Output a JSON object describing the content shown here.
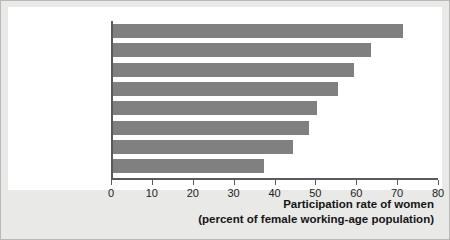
{
  "chart_data": {
    "type": "bar",
    "orientation": "horizontal",
    "title": "",
    "xlabel_line1": "Participation rate of women",
    "xlabel_line2": "(percent of female working-age population)",
    "ylabel": "",
    "categories": [
      "Iceland",
      "Norway",
      "United States",
      "United Kingdom",
      "Germany",
      "France",
      "Spain",
      "Italy"
    ],
    "values": [
      71,
      63,
      59,
      55,
      50,
      48,
      44,
      37
    ],
    "xlim": [
      0,
      80
    ],
    "xticks": [
      0,
      10,
      20,
      30,
      40,
      50,
      60,
      70,
      80
    ],
    "xtick_labels": [
      "0",
      "10",
      "20",
      "30",
      "40",
      "50",
      "60",
      "70",
      "80"
    ],
    "grid": false,
    "legend": null,
    "bar_color": "#808080",
    "axis_color": "#5a5a5a",
    "plot_background": "#ffffff",
    "figure_background": "#e9e9e7"
  }
}
